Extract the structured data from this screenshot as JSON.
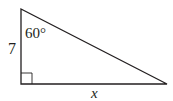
{
  "diagram": {
    "type": "right-triangle",
    "vertices": {
      "top": [
        21,
        9
      ],
      "right_angle": [
        21,
        84
      ],
      "right": [
        167,
        84
      ]
    },
    "labels": {
      "vertical_side": "7",
      "angle": "60°",
      "horizontal_side": "x"
    },
    "right_angle_marker": true,
    "stroke_color": "#231f20"
  }
}
